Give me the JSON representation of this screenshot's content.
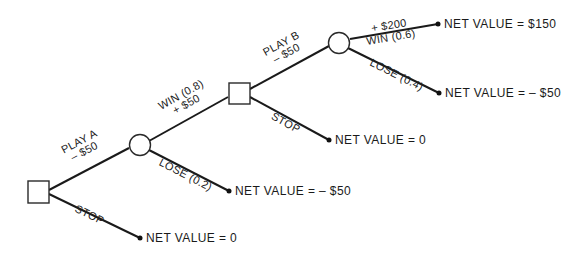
{
  "diagram": {
    "type": "decision-tree",
    "nodes": {
      "decision_a": {
        "kind": "decision"
      },
      "chance_1": {
        "kind": "chance"
      },
      "decision_b": {
        "kind": "decision"
      },
      "chance_2": {
        "kind": "chance"
      }
    },
    "edges": {
      "play_a": {
        "line1": "PLAY A",
        "line2": "– $50"
      },
      "stop_a": {
        "label": "STOP"
      },
      "win_08": {
        "line1": "WIN (0.8)",
        "line2": "+ $50"
      },
      "lose_02": {
        "label": "LOSE (0.2)"
      },
      "play_b": {
        "line1": "PLAY B",
        "line2": "– $50"
      },
      "stop_b": {
        "label": "STOP"
      },
      "win_06": {
        "line1": "+ $200",
        "line2": "WIN (0.6)"
      },
      "lose_04": {
        "label": "LOSE (0.4)"
      }
    },
    "outcomes": {
      "win_b": "NET VALUE = $150",
      "lose_b": "NET VALUE = – $50",
      "stop_b": "NET VALUE = 0",
      "lose_a": "NET VALUE = – $50",
      "stop_a": "NET VALUE = 0"
    }
  }
}
